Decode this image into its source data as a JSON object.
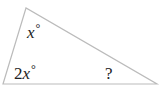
{
  "diagram": {
    "type": "triangle",
    "stroke_color": "#bbbbbb",
    "vertices": {
      "top": [
        26,
        8
      ],
      "bottom_left": [
        3,
        84
      ],
      "bottom_right": [
        157,
        84
      ]
    },
    "angles": {
      "top": {
        "coef": "",
        "var": "x",
        "unit": "°"
      },
      "bottom_left": {
        "coef": "2",
        "var": "x",
        "unit": "°"
      },
      "bottom_right": {
        "text": "?"
      }
    }
  }
}
